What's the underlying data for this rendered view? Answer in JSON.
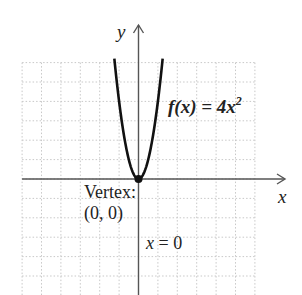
{
  "chart_data": {
    "type": "line",
    "title": "",
    "function": {
      "name": "f",
      "expression": "4x^2",
      "label_prefix": "f(x) = 4x",
      "label_exponent": "2",
      "coefficient": 4,
      "exponent": 2
    },
    "xlabel": "x",
    "ylabel": "y",
    "xlim": [
      -6,
      6
    ],
    "ylim": [
      -6,
      6
    ],
    "grid": true,
    "grid_step": 1,
    "tick_labels_shown": false,
    "x": [
      -1.25,
      -1,
      -0.75,
      -0.5,
      -0.25,
      0,
      0.25,
      0.5,
      0.75,
      1,
      1.25
    ],
    "y": [
      6.25,
      4,
      2.25,
      1,
      0.25,
      0,
      0.25,
      1,
      2.25,
      4,
      6.25
    ],
    "annotations": {
      "vertex": {
        "title": "Vertex:",
        "coords": "(0, 0)",
        "x": 0,
        "y": 0
      },
      "axis_of_symmetry": {
        "variable": "x",
        "equals": " = 0",
        "value": 0
      }
    },
    "colors": {
      "curve": "#111111",
      "axes": "#555555",
      "grid": "#c8c8c8",
      "text": "#222222"
    }
  }
}
